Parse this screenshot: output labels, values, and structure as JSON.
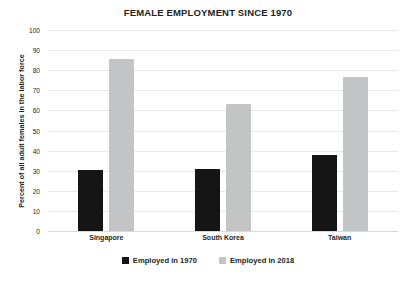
{
  "chart_data": {
    "type": "bar",
    "title": "FEMALE EMPLOYMENT SINCE 1970",
    "xlabel": "",
    "ylabel": "Percent of all adult females in the labor force",
    "categories": [
      "Singapore",
      "South Korea",
      "Taiwan"
    ],
    "series": [
      {
        "name": "Employed in 1970",
        "color": "#151515",
        "values": [
          30.5,
          31,
          38
        ]
      },
      {
        "name": "Employed in 2018",
        "color": "#c3c4c6",
        "values": [
          85.5,
          63,
          76.5
        ]
      }
    ],
    "ylim": [
      0,
      100
    ],
    "ytick_labels": [
      "0",
      "10",
      "20",
      "30",
      "40",
      "50",
      "60",
      "70",
      "80",
      "90",
      "100"
    ],
    "ytick_values": [
      0,
      10,
      20,
      30,
      40,
      50,
      60,
      70,
      80,
      90,
      100
    ],
    "grid": true,
    "legend_position": "bottom"
  }
}
